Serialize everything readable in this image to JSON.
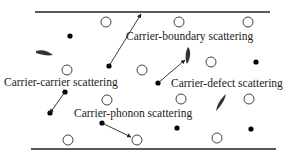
{
  "diagram": {
    "labels": {
      "boundary": "Carrier-boundary scattering",
      "carrier": "Carrier-carrier scattering",
      "defect": "Carrier-defect scattering",
      "phonon": "Carrier-phonon scattering"
    },
    "colors": {
      "line": "#222222",
      "carrier_dot": "#000000",
      "phonon_circle_stroke": "#444444",
      "defect_fill": "#333333",
      "text": "#1a1a1a"
    },
    "elements": {
      "boundaries": [
        "top-boundary-line",
        "bottom-boundary-line"
      ],
      "carriers": "filled black dots",
      "phonons": "open circles",
      "defects": "dark elongated shapes"
    }
  }
}
